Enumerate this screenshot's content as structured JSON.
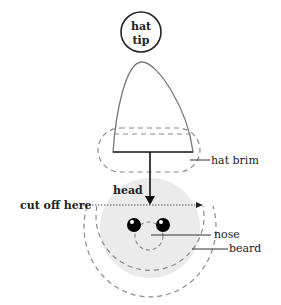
{
  "diagram": {
    "labels": {
      "hat_tip_line1": "hat",
      "hat_tip_line2": "tip",
      "hat_brim": "hat brim",
      "head": "head",
      "cut_off": "cut off here",
      "nose": "nose",
      "beard": "beard"
    },
    "colors": {
      "stroke": "#333333",
      "dashed": "#8a8a8a",
      "head_fill": "#ebebeb",
      "eye_fill": "#000000",
      "text": "#222222"
    }
  }
}
